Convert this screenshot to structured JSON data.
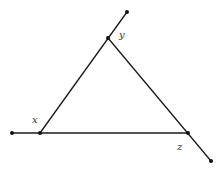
{
  "diagram": {
    "type": "triangle-with-extended-sides",
    "background": "#ffffff",
    "line_color": "#1a1a1a",
    "points": {
      "top_end": {
        "x": 127,
        "y": 12
      },
      "y": {
        "x": 108,
        "y": 38
      },
      "x": {
        "x": 40,
        "y": 133
      },
      "left_end": {
        "x": 12,
        "y": 133
      },
      "z": {
        "x": 188,
        "y": 133
      },
      "right_end": {
        "x": 211,
        "y": 161
      }
    },
    "labels": {
      "x": "x",
      "y": "y",
      "z": "z"
    },
    "segments": [
      [
        "x",
        "top_end"
      ],
      [
        "left_end",
        "z"
      ],
      [
        "y",
        "right_end"
      ]
    ]
  }
}
